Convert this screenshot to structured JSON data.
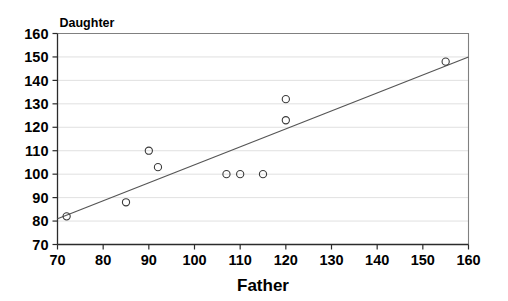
{
  "chart_data": {
    "type": "scatter",
    "title": "",
    "series_label": "Daughter",
    "xlabel": "Father",
    "ylabel": "Daughter",
    "xlim": [
      70,
      160
    ],
    "ylim": [
      70,
      160
    ],
    "xticks": [
      70,
      80,
      90,
      100,
      110,
      120,
      130,
      140,
      150,
      160
    ],
    "yticks": [
      70,
      80,
      90,
      100,
      110,
      120,
      130,
      140,
      150,
      160
    ],
    "xtick_labels": [
      "70",
      "80",
      "90",
      "100",
      "110",
      "120",
      "130",
      "140",
      "150",
      "160"
    ],
    "ytick_labels": [
      "70",
      "80",
      "90",
      "100",
      "110",
      "120",
      "130",
      "140",
      "150",
      "160"
    ],
    "grid": "horizontal",
    "legend": "none",
    "marker": "open-circle",
    "x": [
      72,
      85,
      90,
      92,
      107,
      110,
      115,
      120,
      120,
      155
    ],
    "y": [
      82,
      88,
      110,
      103,
      100,
      100,
      100,
      132,
      123,
      148
    ],
    "points": [
      {
        "x": 72,
        "y": 82
      },
      {
        "x": 85,
        "y": 88
      },
      {
        "x": 90,
        "y": 110
      },
      {
        "x": 92,
        "y": 103
      },
      {
        "x": 107,
        "y": 100
      },
      {
        "x": 110,
        "y": 100
      },
      {
        "x": 115,
        "y": 100
      },
      {
        "x": 120,
        "y": 132
      },
      {
        "x": 120,
        "y": 123
      },
      {
        "x": 155,
        "y": 148
      }
    ],
    "trendline": {
      "type": "linear",
      "x_start": 70,
      "y_start": 81,
      "x_end": 160,
      "y_end": 150
    },
    "colors": {
      "marker_stroke": "#3a3a3a",
      "trendline": "#555555",
      "gridline": "#d8d8d8",
      "axis": "#2b2b2b",
      "frame": "#808080",
      "background": "#ffffff"
    }
  }
}
